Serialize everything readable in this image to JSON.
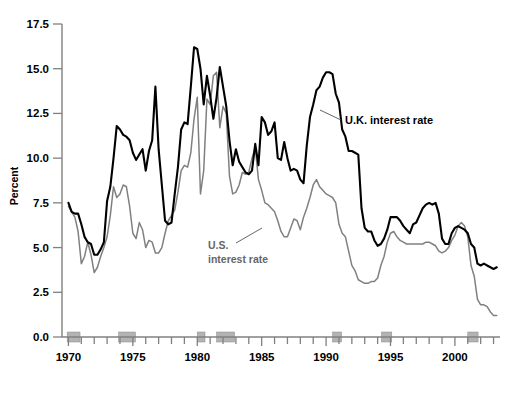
{
  "chart_data": {
    "type": "line",
    "title": "",
    "xlabel": "",
    "ylabel": "Percent",
    "xlim": [
      1969.5,
      2003.5
    ],
    "ylim": [
      0.0,
      17.5
    ],
    "grid": false,
    "legend_position": "inline-annotation",
    "y_ticks": [
      "0.0",
      "2.5",
      "5.0",
      "7.5",
      "10.0",
      "12.5",
      "15.0",
      "17.5"
    ],
    "y_tick_values": [
      0.0,
      2.5,
      5.0,
      7.5,
      10.0,
      12.5,
      15.0,
      17.5
    ],
    "x_ticks": [
      "1970",
      "1975",
      "1980",
      "1985",
      "1990",
      "1995",
      "2000"
    ],
    "x_tick_values": [
      1970,
      1975,
      1980,
      1985,
      1990,
      1995,
      2000
    ],
    "colors": {
      "uk": "#000000",
      "us": "#808080",
      "recession_band": "#b3b3b3",
      "axis": "#808080"
    },
    "annotations": [
      {
        "name": "uk-label",
        "text": "U.K. interest rate",
        "color": "#000000"
      },
      {
        "name": "us-label-line1",
        "text": "U.S.",
        "color": "#666666"
      },
      {
        "name": "us-label-line2",
        "text": "interest rate",
        "color": "#666666"
      }
    ],
    "recession_bands": [
      {
        "start": 1969.9,
        "end": 1970.9
      },
      {
        "start": 1973.9,
        "end": 1975.2
      },
      {
        "start": 1980.0,
        "end": 1980.6
      },
      {
        "start": 1981.5,
        "end": 1982.9
      },
      {
        "start": 1990.5,
        "end": 1991.2
      },
      {
        "start": 1994.3,
        "end": 1995.1
      },
      {
        "start": 2001.0,
        "end": 2001.8
      }
    ],
    "x": [
      1970.0,
      1970.25,
      1970.5,
      1970.75,
      1971.0,
      1971.25,
      1971.5,
      1971.75,
      1972.0,
      1972.25,
      1972.5,
      1972.75,
      1973.0,
      1973.25,
      1973.5,
      1973.75,
      1974.0,
      1974.25,
      1974.5,
      1974.75,
      1975.0,
      1975.25,
      1975.5,
      1975.75,
      1976.0,
      1976.25,
      1976.5,
      1976.75,
      1977.0,
      1977.25,
      1977.5,
      1977.75,
      1978.0,
      1978.25,
      1978.5,
      1978.75,
      1979.0,
      1979.25,
      1979.5,
      1979.75,
      1980.0,
      1980.25,
      1980.5,
      1980.75,
      1981.0,
      1981.25,
      1981.5,
      1981.75,
      1982.0,
      1982.25,
      1982.5,
      1982.75,
      1983.0,
      1983.25,
      1983.5,
      1983.75,
      1984.0,
      1984.25,
      1984.5,
      1984.75,
      1985.0,
      1985.25,
      1985.5,
      1985.75,
      1986.0,
      1986.25,
      1986.5,
      1986.75,
      1987.0,
      1987.25,
      1987.5,
      1987.75,
      1988.0,
      1988.25,
      1988.5,
      1988.75,
      1989.0,
      1989.25,
      1989.5,
      1989.75,
      1990.0,
      1990.25,
      1990.5,
      1990.75,
      1991.0,
      1991.25,
      1991.5,
      1991.75,
      1992.0,
      1992.25,
      1992.5,
      1992.75,
      1993.0,
      1993.25,
      1993.5,
      1993.75,
      1994.0,
      1994.25,
      1994.5,
      1994.75,
      1995.0,
      1995.25,
      1995.5,
      1995.75,
      1996.0,
      1996.25,
      1996.5,
      1996.75,
      1997.0,
      1997.25,
      1997.5,
      1997.75,
      1998.0,
      1998.25,
      1998.5,
      1998.75,
      1999.0,
      1999.25,
      1999.5,
      1999.75,
      2000.0,
      2000.25,
      2000.5,
      2000.75,
      2001.0,
      2001.25,
      2001.5,
      2001.75,
      2002.0,
      2002.25,
      2002.5,
      2002.75,
      2003.0,
      2003.25
    ],
    "series": [
      {
        "name": "U.K. interest rate",
        "color": "#000000",
        "values": [
          7.5,
          7.0,
          6.9,
          6.9,
          6.3,
          5.6,
          5.3,
          5.2,
          4.6,
          4.6,
          4.9,
          5.3,
          7.6,
          8.4,
          10.0,
          11.8,
          11.6,
          11.3,
          11.2,
          11.0,
          10.3,
          9.9,
          10.2,
          10.5,
          9.3,
          10.4,
          11.0,
          14.0,
          10.5,
          8.5,
          6.5,
          6.3,
          6.4,
          8.0,
          9.5,
          11.6,
          12.0,
          11.9,
          14.0,
          16.2,
          16.1,
          15.0,
          13.0,
          14.6,
          13.5,
          12.2,
          13.4,
          15.1,
          14.0,
          12.9,
          11.0,
          9.6,
          10.5,
          9.8,
          9.5,
          9.2,
          9.1,
          9.3,
          10.8,
          9.6,
          12.3,
          12.0,
          11.3,
          11.5,
          12.0,
          10.0,
          9.9,
          10.9,
          10.0,
          9.3,
          9.4,
          9.3,
          8.8,
          8.6,
          10.7,
          12.3,
          13.0,
          13.8,
          14.0,
          14.5,
          14.8,
          14.8,
          14.7,
          13.6,
          13.1,
          11.6,
          11.2,
          10.4,
          10.4,
          10.3,
          10.2,
          7.2,
          6.1,
          5.9,
          5.9,
          5.4,
          5.1,
          5.2,
          5.5,
          6.0,
          6.7,
          6.7,
          6.7,
          6.5,
          6.2,
          6.0,
          5.8,
          6.3,
          6.4,
          6.8,
          7.2,
          7.4,
          7.5,
          7.4,
          7.5,
          6.9,
          5.5,
          5.2,
          5.2,
          5.8,
          6.1,
          6.2,
          6.1,
          6.0,
          5.8,
          5.2,
          5.0,
          4.1,
          4.0,
          4.1,
          4.0,
          3.9,
          3.8,
          3.9
        ]
      },
      {
        "name": "U.S. interest rate",
        "color": "#808080",
        "values": [
          7.3,
          7.0,
          6.7,
          5.9,
          4.1,
          4.5,
          5.3,
          4.6,
          3.6,
          3.9,
          4.5,
          5.0,
          5.6,
          6.8,
          8.4,
          7.8,
          8.0,
          8.5,
          8.4,
          7.3,
          5.8,
          5.5,
          6.4,
          6.0,
          5.0,
          5.4,
          5.3,
          4.7,
          4.7,
          5.0,
          5.8,
          6.5,
          6.8,
          7.1,
          8.1,
          9.3,
          9.6,
          9.5,
          10.3,
          12.2,
          13.4,
          8.0,
          9.3,
          13.3,
          13.0,
          14.6,
          14.8,
          11.7,
          12.9,
          12.5,
          9.0,
          8.0,
          8.1,
          8.5,
          9.2,
          9.1,
          9.2,
          10.0,
          10.6,
          8.8,
          8.2,
          7.5,
          7.4,
          7.2,
          7.0,
          6.5,
          5.9,
          5.6,
          5.6,
          6.1,
          6.6,
          6.5,
          6.0,
          6.7,
          7.2,
          7.8,
          8.5,
          8.8,
          8.4,
          8.2,
          8.0,
          7.9,
          7.8,
          7.5,
          6.3,
          5.8,
          5.6,
          4.8,
          4.0,
          3.7,
          3.2,
          3.1,
          3.0,
          3.0,
          3.1,
          3.1,
          3.3,
          4.0,
          4.5,
          5.3,
          5.8,
          5.9,
          5.6,
          5.4,
          5.3,
          5.2,
          5.2,
          5.2,
          5.2,
          5.2,
          5.2,
          5.3,
          5.3,
          5.2,
          5.1,
          4.8,
          4.7,
          4.8,
          5.0,
          5.4,
          5.7,
          6.2,
          6.4,
          6.2,
          5.6,
          4.0,
          3.4,
          2.1,
          1.8,
          1.8,
          1.7,
          1.4,
          1.2,
          1.2
        ]
      }
    ]
  },
  "axis_titles": {
    "y": "Percent"
  }
}
